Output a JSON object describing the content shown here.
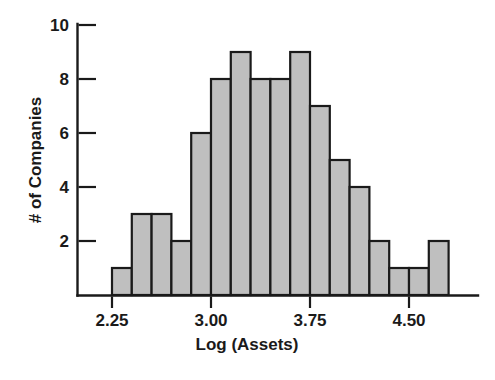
{
  "chart_data": {
    "type": "bar",
    "title": "",
    "xlabel": "Log (Assets)",
    "ylabel": "# of Companies",
    "xlim": [
      2.175,
      2.775
    ],
    "ylim": [
      0,
      10
    ],
    "grid": false,
    "legend": null,
    "bin_width": 0.15,
    "bin_starts": [
      2.25,
      2.4,
      2.55,
      2.7,
      2.85,
      3.0,
      3.15,
      3.3,
      3.45,
      3.6,
      3.75,
      3.9,
      4.05,
      4.2,
      4.35,
      4.5,
      4.65
    ],
    "bin_ends": [
      2.4,
      2.55,
      2.7,
      2.85,
      3.0,
      3.15,
      3.3,
      3.45,
      3.6,
      3.75,
      3.9,
      4.05,
      4.2,
      4.35,
      4.5,
      4.65,
      4.8
    ],
    "categories": [
      "2.25-2.40",
      "2.40-2.55",
      "2.55-2.70",
      "2.70-2.85",
      "2.85-3.00",
      "3.00-3.15",
      "3.15-3.30",
      "3.30-3.45",
      "3.45-3.60",
      "3.60-3.75",
      "3.75-3.90",
      "3.90-4.05",
      "4.05-4.20",
      "4.20-4.35",
      "4.35-4.50",
      "4.50-4.65",
      "4.65-4.80"
    ],
    "values": [
      1,
      3,
      3,
      2,
      6,
      8,
      9,
      8,
      8,
      9,
      7,
      5,
      4,
      2,
      1,
      1,
      2
    ],
    "xticks": [
      2.25,
      3.0,
      3.75,
      4.5
    ],
    "xticklabels": [
      "2.25",
      "3.00",
      "3.75",
      "4.50"
    ],
    "yticks": [
      2,
      4,
      6,
      8,
      10
    ],
    "yticklabels": [
      "2",
      "4",
      "6",
      "8",
      "10"
    ],
    "bar_fill_color": "#bfbfbf",
    "bar_edge_color": "#1a1a1a",
    "axis_color": "#1a1a1a",
    "background_color": "#ffffff",
    "total_count": 79
  },
  "axes": {
    "x_title": "Log (Assets)",
    "y_title": "# of Companies"
  }
}
